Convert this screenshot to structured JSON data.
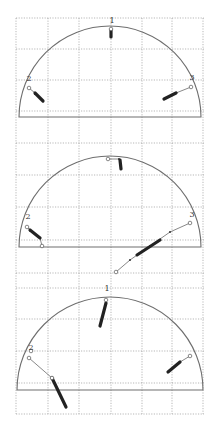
{
  "figure": {
    "width": 215,
    "height": 431,
    "background": "#ffffff",
    "grid_color": "#9a9a9a",
    "outline_color": "#6e6e6e",
    "trace_color": "#222222",
    "grid": {
      "x": [
        16,
        48,
        79,
        111,
        142,
        172,
        203
      ],
      "y": [
        18,
        49,
        80,
        111,
        143,
        175,
        207,
        240,
        273,
        288,
        319,
        351,
        383,
        414
      ],
      "x_extent": [
        16,
        204
      ],
      "y_extent": [
        18,
        414
      ]
    }
  },
  "panels": [
    {
      "name": "panel-1",
      "semicircle": {
        "cx": 110,
        "baseline_y": 117,
        "r": 91
      },
      "points": [
        {
          "label": "1",
          "label_pos": [
            112,
            23
          ],
          "markers": [
            [
              111,
              29
            ]
          ],
          "thick": [
            [
              111,
              30
            ],
            [
              111,
              37
            ]
          ],
          "thin": []
        },
        {
          "label": "2",
          "label_pos": [
            29,
            81
          ],
          "markers": [
            [
              29,
              88
            ]
          ],
          "thin": [
            [
              29,
              88
            ],
            [
              35,
              93
            ]
          ],
          "thick": [
            [
              35,
              93
            ],
            [
              43,
              101
            ]
          ]
        },
        {
          "label": "3",
          "label_pos": [
            192,
            80
          ],
          "markers": [
            [
              191,
              87
            ]
          ],
          "thin": [
            [
              191,
              87
            ],
            [
              176,
              93
            ]
          ],
          "thick": [
            [
              176,
              93
            ],
            [
              164,
              99
            ]
          ]
        }
      ]
    },
    {
      "name": "panel-2",
      "semicircle": {
        "cx": 110,
        "baseline_y": 247,
        "r": 91
      },
      "points": [
        {
          "label": "",
          "label_pos": [
            0,
            0
          ],
          "markers": [
            [
              108,
              159
            ]
          ],
          "thin": [
            [
              108,
              159
            ],
            [
              119,
              159
            ]
          ],
          "thick": [
            [
              120,
              160
            ],
            [
              121,
              169
            ]
          ]
        },
        {
          "label": "2",
          "label_pos": [
            28,
            219
          ],
          "markers": [
            [
              27,
              227
            ],
            [
              42,
              246
            ]
          ],
          "thin": [
            [
              27,
              227
            ],
            [
              30,
              230
            ],
            [
              40,
              238
            ],
            [
              42,
              246
            ]
          ],
          "thick": [
            [
              30,
              230
            ],
            [
              40,
              238
            ]
          ]
        },
        {
          "label": "3",
          "label_pos": [
            192,
            217
          ],
          "markers": [
            [
              190,
              223
            ],
            [
              116,
              272
            ]
          ],
          "thin": [
            [
              190,
              223
            ],
            [
              170,
              232
            ],
            [
              150,
              246
            ],
            [
              130,
              260
            ],
            [
              116,
              272
            ]
          ],
          "thick": [
            [
              160,
              240
            ],
            [
              137,
              255
            ]
          ]
        }
      ]
    },
    {
      "name": "panel-3",
      "semicircle": {
        "cx": 110,
        "baseline_y": 390,
        "r": 93
      },
      "points": [
        {
          "label": "1",
          "label_pos": [
            107,
            291
          ],
          "markers": [
            [
              106,
              300
            ]
          ],
          "thin": [],
          "thick": [
            [
              106,
              303
            ],
            [
              100,
              326
            ]
          ]
        },
        {
          "label": "2",
          "label_pos": [
            31,
            350
          ],
          "markers": [
            [
              31,
              351
            ],
            [
              29,
              358
            ],
            [
              52,
              378
            ]
          ],
          "thin": [
            [
              29,
              358
            ],
            [
              52,
              378
            ]
          ],
          "thick": [
            [
              52,
              378
            ],
            [
              66,
              407
            ]
          ]
        },
        {
          "label": "",
          "label_pos": [
            0,
            0
          ],
          "markers": [
            [
              190,
              356
            ]
          ],
          "thin": [
            [
              190,
              356
            ],
            [
              180,
              362
            ]
          ],
          "thick": [
            [
              180,
              362
            ],
            [
              168,
              372
            ]
          ]
        }
      ]
    }
  ]
}
